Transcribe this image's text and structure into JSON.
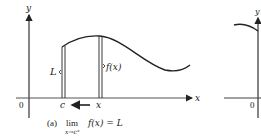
{
  "figure": {
    "panel_a": {
      "axis_x_label": "x",
      "axis_y_label": "y",
      "origin_label": "0",
      "curve_label": "f(x)",
      "limit_label": "L",
      "point_c_label": "c",
      "point_x_label": "x",
      "caption_tag": "(a)",
      "caption_lim": "lim",
      "caption_sub": "x→c⁺",
      "caption_expr": "f(x) = L"
    },
    "panel_b": {
      "axis_y_label": "y",
      "origin_label": "0"
    },
    "colors": {
      "line": "#222222",
      "background": "#ffffff"
    }
  }
}
